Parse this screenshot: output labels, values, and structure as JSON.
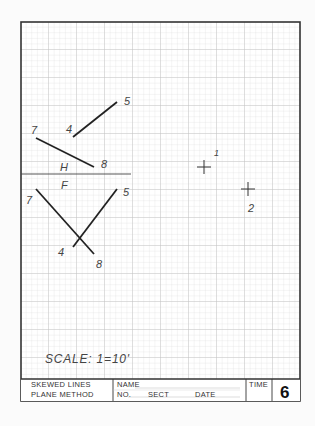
{
  "drawing": {
    "views": {
      "top_label": "H",
      "front_label": "F"
    },
    "top_view": {
      "line_4_5": {
        "start_label": "4",
        "end_label": "5"
      },
      "line_7_8": {
        "start_label": "7",
        "end_label": "8"
      }
    },
    "front_view": {
      "line_4_5": {
        "start_label": "4",
        "end_label": "5"
      },
      "line_7_8": {
        "start_label": "7",
        "end_label": "8"
      }
    },
    "points": [
      {
        "label": "1"
      },
      {
        "label": "2"
      }
    ],
    "scale_text": "SCALE:  1=10'"
  },
  "title_block": {
    "title_line1": "SKEWED  LINES",
    "title_line2": "PLANE  METHOD",
    "name_label": "NAME",
    "no_label": "NO.",
    "sect_label": "SECT",
    "date_label": "DATE",
    "time_label": "TIME",
    "sheet_number": "6"
  },
  "colors": {
    "grid_minor": "#dcdcdc",
    "grid_major": "#c4c4c4",
    "ink": "#222222",
    "border": "#333333"
  }
}
